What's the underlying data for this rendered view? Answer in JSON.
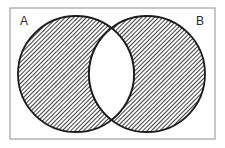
{
  "venn": {
    "set_a_label": "A",
    "set_b_label": "B",
    "shaded_regions": [
      "A only",
      "B only"
    ],
    "unshaded_regions": [
      "A intersection B"
    ]
  },
  "colors": {
    "outline": "#1c1c1c",
    "hatch": "#404040",
    "frame_border": "#a8a8a8",
    "background": "#ffffff",
    "intersection_fill": "#ffffff"
  }
}
